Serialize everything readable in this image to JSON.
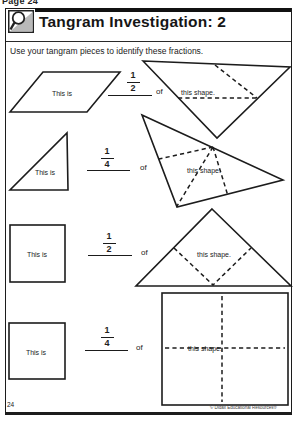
{
  "page": {
    "top_label": "Page 24",
    "page_number": "24",
    "copyright": "© Didax Educational Resources®"
  },
  "header": {
    "title": "Tangram Investigation: 2",
    "icon": "magnifier"
  },
  "instruction": "Use your tangram pieces to identify these fractions.",
  "rows": [
    {
      "left_shape": "parallelogram",
      "left_label": "This is",
      "fraction": {
        "numerator": "1",
        "denominator": "2"
      },
      "connector": "of",
      "right_shape": "large-triangle-pointing-down-with-dashed-divisions",
      "right_label": "this shape."
    },
    {
      "left_shape": "small-right-triangle",
      "left_label": "This is",
      "fraction": {
        "numerator": "1",
        "denominator": "4"
      },
      "connector": "of",
      "right_shape": "large-rotated-triangle-with-dashed-quarters",
      "right_label": "this shape."
    },
    {
      "left_shape": "small-square",
      "left_label": "This is",
      "fraction": {
        "numerator": "1",
        "denominator": "2"
      },
      "connector": "of",
      "right_shape": "large-triangle-pointing-up-with-dashed-inner-square",
      "right_label": "this shape."
    },
    {
      "left_shape": "small-square",
      "left_label": "This is",
      "fraction": {
        "numerator": "1",
        "denominator": "4"
      },
      "connector": "of",
      "right_shape": "large-square-with-dashed-quadrants",
      "right_label": "this shape."
    }
  ],
  "colors": {
    "ink": "#1c1c1c",
    "paper": "#ffffff",
    "icon_gray": "#b9b9b9"
  }
}
